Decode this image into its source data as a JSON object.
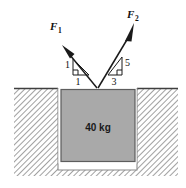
{
  "figure": {
    "colors": {
      "block_fill": "#a9a9a9",
      "block_border": "#5a5a5a",
      "ground_hatch": "#6e6e6e",
      "ground_line": "#4a4a4a",
      "arrow": "#1a1a1a",
      "background": "#ffffff"
    }
  },
  "forces": [
    {
      "name": "F1",
      "label_base": "F",
      "label_sub": "1",
      "slope_rise": "1",
      "slope_run": "1",
      "direction": "up-left"
    },
    {
      "name": "F2",
      "label_base": "F",
      "label_sub": "2",
      "slope_rise": "5",
      "slope_run": "3",
      "direction": "up-right"
    }
  ],
  "block": {
    "mass_label": "40 kg"
  }
}
